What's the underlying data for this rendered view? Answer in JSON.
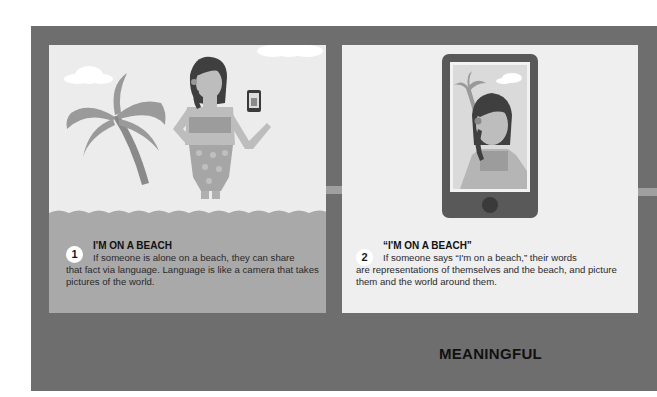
{
  "panels": [
    {
      "number": "1",
      "title": "I'M ON A BEACH",
      "text_line1": "If someone is alone on a beach, they can share",
      "text_rest": "that fact via language. Language is like a camera that takes pictures of the world.",
      "illustration": "woman-on-beach-holding-phone"
    },
    {
      "number": "2",
      "title": "“I'M ON A BEACH”",
      "text_line1": "If someone says “I'm on a beach,” their words",
      "text_rest": "are representations of themselves and the beach, and picture them and the world around them.",
      "illustration": "phone-showing-selfie"
    }
  ],
  "footer_label": "MEANINGFUL",
  "icons": {
    "connector": "arrow-right-icon"
  },
  "colors": {
    "frame": "#6e6e6e",
    "panel": "#ececec",
    "sea": "#a9a9a9",
    "arrow": "#a0a0a0"
  }
}
